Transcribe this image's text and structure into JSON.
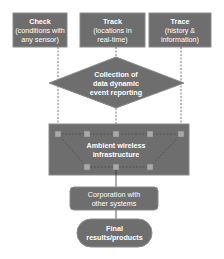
{
  "colors": {
    "box_fill": "#6e6e6e",
    "box_stroke": "#8a8a8a",
    "line": "#555555",
    "node_fill": "#a9a9a9",
    "text": "#ffffff",
    "background": "#ffffff"
  },
  "inputs": [
    {
      "title": "Check",
      "line1": "(conditions with",
      "line2": "any sensor)"
    },
    {
      "title": "Track",
      "line1": "(locations in",
      "line2": "real-time)"
    },
    {
      "title": "Trace",
      "line1": "(history &",
      "line2": "information)"
    }
  ],
  "decision": {
    "line1": "Collection of",
    "line2": "data dynamic",
    "line3": "event reporting"
  },
  "infrastructure": {
    "line1": "Ambient wireless",
    "line2": "infrastructure"
  },
  "corporation": {
    "line1": "Corporation with",
    "line2": "other systems"
  },
  "final": {
    "line1": "Final",
    "line2": "results/products"
  }
}
